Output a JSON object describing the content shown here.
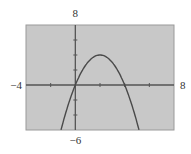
{
  "chart_data": {
    "type": "line",
    "title": "",
    "xlabel": "",
    "ylabel": "",
    "xlim": [
      -4,
      8
    ],
    "ylim": [
      -6,
      8
    ],
    "xtick_step": 2,
    "ytick_step": 2,
    "grid": false,
    "legend": null,
    "window_labels": {
      "xmin": "−4",
      "xmax": "8",
      "ymin": "−6",
      "ymax": "8"
    },
    "series": [
      {
        "name": "y = -x^2 + 4x",
        "function": "-x^2+4x",
        "x": [
          -1.16,
          -1,
          0,
          1,
          2,
          3,
          4,
          5,
          5.16
        ],
        "y": [
          -6,
          -5,
          0,
          3,
          4,
          3,
          0,
          -5,
          -6
        ]
      }
    ],
    "colors": {
      "background": "#c8c8c8",
      "axes": "#555555",
      "curve": "#4a4a4a",
      "frame": "#9a9a9a"
    }
  }
}
